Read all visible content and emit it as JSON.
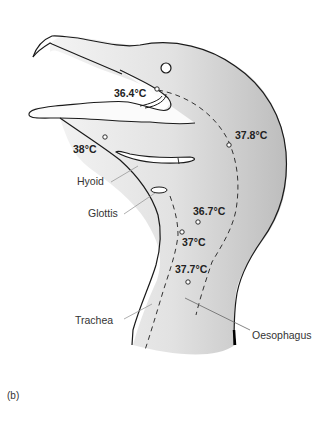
{
  "figure": {
    "panel_label": "(b)",
    "colors": {
      "fill_light": "#f4f4f4",
      "fill_dark": "#c9c9c9",
      "outline": "#1a1a1a",
      "leader_line": "#999999"
    }
  },
  "temperatures": [
    {
      "id": "mouth",
      "value": "36.4°C"
    },
    {
      "id": "head-right",
      "value": "37.8°C"
    },
    {
      "id": "throat",
      "value": "38°C"
    },
    {
      "id": "neck-upper",
      "value": "36.7°C"
    },
    {
      "id": "trachea-upper",
      "value": "37°C"
    },
    {
      "id": "neck-lower",
      "value": "37.7°C"
    }
  ],
  "anatomy_labels": [
    {
      "id": "hyoid",
      "label": "Hyoid"
    },
    {
      "id": "glottis",
      "label": "Glottis"
    },
    {
      "id": "trachea",
      "label": "Trachea"
    },
    {
      "id": "oesophagus",
      "label": "Oesophagus"
    }
  ]
}
